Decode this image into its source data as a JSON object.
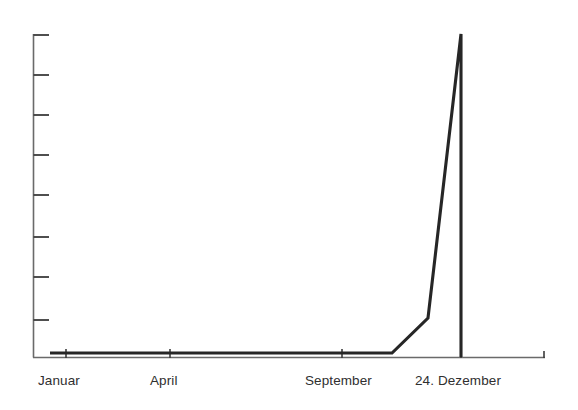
{
  "chart_data": {
    "type": "line",
    "title": "",
    "subtitle": "",
    "xlabel": "",
    "ylabel": "",
    "grid": false,
    "legend": false,
    "legend_position": "none",
    "line_color": "#262626",
    "axis_color": "#6a6a6a",
    "label_color": "#2f2f2f",
    "background": "#ffffff",
    "x_tick_labels": [
      "Januar",
      "April",
      "September",
      "24. Dezember"
    ],
    "x_tick_positions": [
      66,
      170,
      342,
      461
    ],
    "y_tick_count": 8,
    "y_tick_positions": [
      35,
      75,
      115,
      155,
      195,
      237,
      277,
      320
    ],
    "y_tick_labels": [],
    "xlim": [
      33,
      545
    ],
    "ylim": [
      0,
      8
    ],
    "annotation": "",
    "series": [
      {
        "name": "Weihnachtsstimmung",
        "points": [
          {
            "x": 50,
            "y": 353
          },
          {
            "x": 392,
            "y": 353
          },
          {
            "x": 428,
            "y": 318
          },
          {
            "x": 461,
            "y": 34
          },
          {
            "x": 461,
            "y": 357
          }
        ]
      }
    ],
    "values_by_month": [
      {
        "label": "Januar",
        "value": 0.1
      },
      {
        "label": "April",
        "value": 0.1
      },
      {
        "label": "September",
        "value": 0.1
      },
      {
        "label": "24. Dezember",
        "value": 8.0
      }
    ]
  },
  "axes": {
    "y_axis": {
      "x": 33,
      "y_top": 34,
      "y_bottom": 357,
      "tick_length": 15
    },
    "x_axis": {
      "y": 357,
      "x_left": 33,
      "x_right": 545,
      "tick_length": 9,
      "end_tick_length": 7
    }
  }
}
